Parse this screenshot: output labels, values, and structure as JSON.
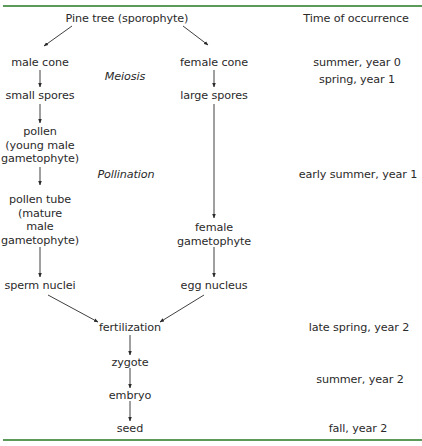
{
  "header": {
    "title": "Pine tree (sporophyte)",
    "time_column_header": "Time of occurrence"
  },
  "male_branch": {
    "cone": "male cone",
    "spores": "small spores",
    "pollen": [
      "pollen",
      "(young male",
      "gametophyte)"
    ],
    "pollen_tube": [
      "pollen tube",
      "(mature",
      "male",
      "gametophyte)"
    ],
    "nuclei": "sperm nuclei"
  },
  "female_branch": {
    "cone": "female cone",
    "spores": "large spores",
    "gametophyte": [
      "female",
      "gametophyte"
    ],
    "nuclei": "egg nucleus"
  },
  "processes": {
    "meiosis": "Meiosis",
    "pollination": "Pollination"
  },
  "merged": {
    "fertilization": "fertilization",
    "zygote": "zygote",
    "embryo": "embryo",
    "seed": "seed"
  },
  "timeline": [
    "summer, year 0",
    "spring, year 1",
    "early summer, year 1",
    "late spring, year 2",
    "summer, year 2",
    "fall, year 2"
  ],
  "colors": {
    "rule": "#5c9a5a",
    "text": "#2a2a2a"
  }
}
